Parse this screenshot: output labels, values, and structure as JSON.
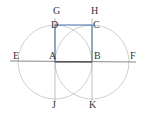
{
  "diagram": {
    "labels": {
      "A": "A",
      "B": "B",
      "C": "C",
      "D": "D",
      "E": "E",
      "F": "F",
      "G": "G",
      "H": "H",
      "J": "J",
      "K": "K"
    },
    "points": {
      "A": [
        55,
        62
      ],
      "B": [
        92,
        62
      ],
      "C": [
        92,
        25
      ],
      "D": [
        55,
        25
      ]
    },
    "circle_radius": 37,
    "colors": {
      "square": "#3a6ea8",
      "circles": "#aaaaaa",
      "lines": "#888888",
      "baseline": "#333333"
    }
  }
}
